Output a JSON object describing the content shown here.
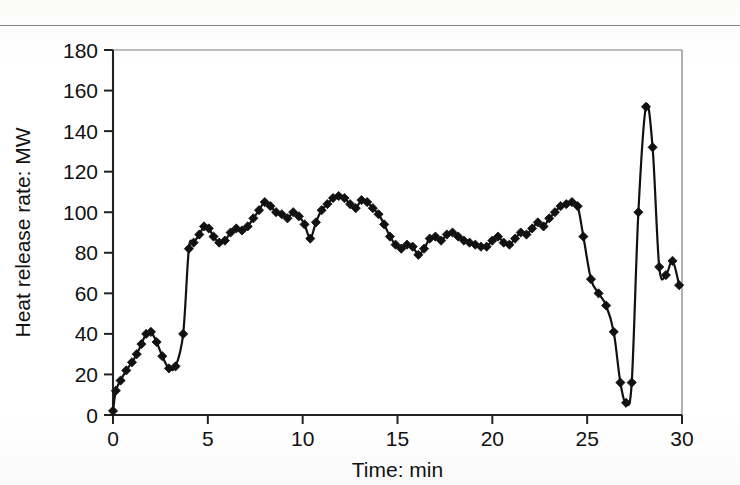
{
  "figure": {
    "background_color": "#fdfdfc",
    "ink_color": "#111111",
    "axis_color": "#222222"
  },
  "chart_data": {
    "type": "line",
    "title": "",
    "xlabel": "Time: min",
    "ylabel": "Heat release rate: MW",
    "xlim": [
      0,
      30
    ],
    "ylim": [
      0,
      180
    ],
    "xticks": [
      0,
      5,
      10,
      15,
      20,
      25,
      30
    ],
    "yticks": [
      0,
      20,
      40,
      60,
      80,
      100,
      120,
      140,
      160,
      180
    ],
    "xtick_labels": [
      "0",
      "5",
      "10",
      "15",
      "20",
      "25",
      "30"
    ],
    "ytick_labels": [
      "0",
      "20",
      "40",
      "60",
      "80",
      "100",
      "120",
      "140",
      "160",
      "180"
    ],
    "grid": false,
    "legend": false,
    "marker": "filled-diamond",
    "marker_color": "#111111",
    "line_color": "#111111",
    "series": [
      {
        "name": "Heat release rate",
        "x": [
          0.0,
          0.15,
          0.4,
          0.7,
          1.0,
          1.25,
          1.5,
          1.75,
          2.0,
          2.3,
          2.6,
          2.95,
          3.3,
          3.7,
          4.0,
          4.25,
          4.55,
          4.8,
          5.05,
          5.3,
          5.6,
          5.9,
          6.2,
          6.5,
          6.8,
          7.1,
          7.4,
          7.7,
          8.0,
          8.3,
          8.6,
          8.9,
          9.2,
          9.5,
          9.8,
          10.1,
          10.4,
          10.7,
          11.0,
          11.3,
          11.6,
          11.9,
          12.2,
          12.5,
          12.8,
          13.1,
          13.4,
          13.7,
          14.0,
          14.3,
          14.6,
          14.9,
          15.2,
          15.5,
          15.8,
          16.1,
          16.4,
          16.7,
          17.0,
          17.3,
          17.6,
          17.9,
          18.2,
          18.5,
          18.8,
          19.1,
          19.4,
          19.7,
          20.0,
          20.3,
          20.6,
          20.9,
          21.2,
          21.5,
          21.8,
          22.1,
          22.4,
          22.7,
          23.0,
          23.3,
          23.6,
          23.9,
          24.2,
          24.5,
          24.8,
          25.2,
          25.6,
          26.0,
          26.4,
          26.75,
          27.05,
          27.35,
          27.7,
          28.1,
          28.45,
          28.8,
          29.15,
          29.5,
          29.85
        ],
        "y": [
          2,
          12,
          17,
          22,
          26,
          30,
          35,
          40,
          41,
          36,
          29,
          23,
          24,
          40,
          82,
          85,
          89,
          93,
          92,
          88,
          85,
          86,
          90,
          92,
          91,
          93,
          97,
          101,
          105,
          103,
          100,
          99,
          97,
          100,
          98,
          94,
          87,
          95,
          101,
          104,
          107,
          108,
          107,
          104,
          102,
          106,
          105,
          102,
          99,
          94,
          88,
          84,
          82,
          84,
          83,
          79,
          82,
          87,
          88,
          86,
          89,
          90,
          88,
          86,
          85,
          84,
          83,
          83,
          86,
          88,
          85,
          84,
          87,
          90,
          89,
          92,
          95,
          93,
          97,
          100,
          103,
          104,
          105,
          103,
          88,
          67,
          60,
          54,
          41,
          16,
          6,
          16,
          100,
          152,
          132,
          73,
          69,
          76,
          64
        ]
      }
    ]
  },
  "axes": {
    "ylabel_text": "Heat release rate: MW",
    "xlabel_text": "Time: min"
  }
}
